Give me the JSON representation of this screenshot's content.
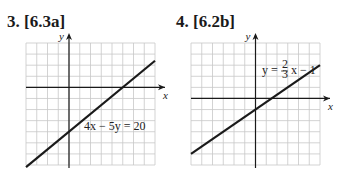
{
  "problems": [
    {
      "number": "3.",
      "ref": "[6.3a]",
      "title": "3. [6.3a]"
    },
    {
      "number": "4.",
      "ref": "[6.2b]",
      "title": "4. [6.2b]"
    }
  ],
  "colors": {
    "grid": "#c8c8c8",
    "axis": "#1a1a1a",
    "line": "#1a1a1a",
    "text": "#1a1a1a"
  },
  "chart_data": [
    {
      "type": "line",
      "title": "3. [6.3a]",
      "equation": "4x − 5y = 20",
      "xlabel": "x",
      "ylabel": "y",
      "xlim": [
        -4,
        8
      ],
      "ylim": [
        -7,
        4
      ],
      "grid": true,
      "series": [
        {
          "name": "4x − 5y = 20",
          "x": [
            -4,
            8
          ],
          "y": [
            -7.2,
            2.4
          ]
        }
      ],
      "annotations": [
        {
          "text": "4x − 5y = 20",
          "x": 1.5,
          "y": -3.3
        }
      ],
      "intercepts": {
        "x": 5,
        "y": -4
      }
    },
    {
      "type": "line",
      "title": "4. [6.2b]",
      "equation": "y = (2/3)x − 1",
      "xlabel": "x",
      "ylabel": "y",
      "xlim": [
        -6,
        6
      ],
      "ylim": [
        -6,
        5
      ],
      "grid": true,
      "series": [
        {
          "name": "y = 2/3 x − 1",
          "x": [
            -6,
            6
          ],
          "y": [
            -5,
            3
          ]
        }
      ],
      "annotations": [
        {
          "text": "y = 2/3 x − 1",
          "x": 1.5,
          "y": 3.5
        }
      ],
      "intercepts": {
        "x": 1.5,
        "y": -1
      }
    }
  ],
  "labels": {
    "g1_eq": "4x − 5y = 20",
    "g2_eq_lhs": "y =",
    "g2_eq_num": "2",
    "g2_eq_den": "3",
    "g2_eq_rhs": "x − 1",
    "x": "x",
    "y": "y"
  }
}
